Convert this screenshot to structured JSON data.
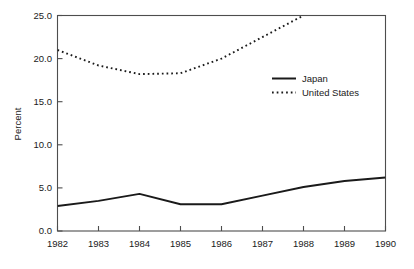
{
  "chart_data": {
    "type": "line",
    "title": "",
    "subtitle": "",
    "xlabel": "",
    "ylabel": "Percent",
    "x": [
      1982,
      1983,
      1984,
      1985,
      1986,
      1987,
      1988,
      1989,
      1990
    ],
    "categories": [
      "1982",
      "1983",
      "1984",
      "1985",
      "1986",
      "1987",
      "1988",
      "1989",
      "1990"
    ],
    "xlim": [
      1982,
      1990
    ],
    "ylim": [
      0.0,
      25.0
    ],
    "yticks": [
      0.0,
      5.0,
      10.0,
      15.0,
      20.0,
      25.0
    ],
    "ytick_labels": [
      "0.0",
      "5.0",
      "10.0",
      "15.0",
      "20.0",
      "25.0"
    ],
    "xticks": [
      1982,
      1983,
      1984,
      1985,
      1986,
      1987,
      1988,
      1989,
      1990
    ],
    "xtick_labels": [
      "1982",
      "1983",
      "1984",
      "1985",
      "1986",
      "1987",
      "1988",
      "1989",
      "1990"
    ],
    "grid": false,
    "legend_position": "upper right inside",
    "series": [
      {
        "name": "Japan",
        "style": "solid",
        "color": "#1a1a1a",
        "x": [
          1982,
          1983,
          1984,
          1985,
          1986,
          1987,
          1988,
          1989,
          1990
        ],
        "values": [
          2.9,
          3.5,
          4.3,
          3.1,
          3.1,
          4.1,
          5.1,
          5.8,
          6.2
        ]
      },
      {
        "name": "United States",
        "style": "dotted",
        "color": "#1a1a1a",
        "clipped_at_top": true,
        "x": [
          1982,
          1983,
          1984,
          1985,
          1986,
          1987,
          1988
        ],
        "values": [
          21.0,
          19.2,
          18.2,
          18.3,
          20.0,
          22.5,
          25.0
        ]
      }
    ]
  },
  "legend": {
    "items": [
      {
        "label": "Japan"
      },
      {
        "label": "United States"
      }
    ]
  },
  "axis": {
    "y_title": "Percent"
  }
}
